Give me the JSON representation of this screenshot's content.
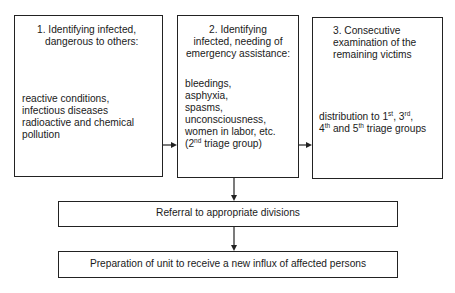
{
  "diagram": {
    "type": "flowchart",
    "boxes": [
      {
        "id": "step1",
        "title_lines": [
          "1. Identifying infected,",
          "dangerous to others:"
        ],
        "body_lines": [
          "reactive conditions,",
          "infectious diseases",
          "radioactive and chemical",
          "pollution"
        ]
      },
      {
        "id": "step2",
        "title_lines": [
          "2. Identifying",
          "infected, needing of",
          "emergency assistance:"
        ],
        "body_lines": [
          "bleedings,",
          "asphyxia,",
          "spasms,",
          "unconsciousness,",
          "women in labor, etc."
        ],
        "body_last": {
          "pre": "(2",
          "sup": "nd",
          "post": " triage group)"
        }
      },
      {
        "id": "step3",
        "title_lines": [
          "3. Consecutive",
          "examination of the",
          "remaining victims"
        ],
        "body_line1": {
          "a": "distribution to  1",
          "a_sup": "st",
          "b": ", 3",
          "b_sup": "rd",
          "c": ","
        },
        "body_line2": {
          "a": "4",
          "a_sup": "th",
          "b": " and 5",
          "b_sup": "th",
          "c": " triage groups"
        }
      },
      {
        "id": "referral",
        "label": "Referral to appropriate divisions"
      },
      {
        "id": "preparation",
        "label": "Preparation of unit to receive a new influx of affected persons"
      }
    ],
    "edges": [
      {
        "from": "step1",
        "to": "step2"
      },
      {
        "from": "step2",
        "to": "step3"
      },
      {
        "from": "step2",
        "to": "referral"
      },
      {
        "from": "referral",
        "to": "preparation"
      }
    ],
    "colors": {
      "line": "#222222",
      "background": "#ffffff",
      "text": "#1a1a1a"
    }
  }
}
